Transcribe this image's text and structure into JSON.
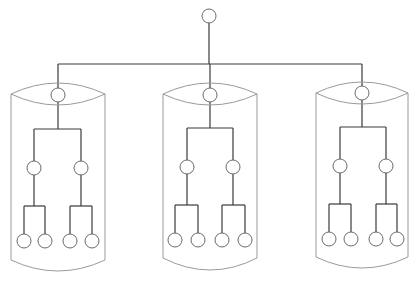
{
  "diagram": {
    "type": "hierarchical-tree",
    "colors": {
      "background": "#ffffff",
      "wire": "#3a3a3a",
      "node_stroke": "#6a6a6a",
      "shell_stroke": "#9a9a9a"
    },
    "root": {
      "cx": 209,
      "cy": 16,
      "r": 7
    },
    "bus": {
      "y": 64,
      "x1": 58,
      "x2": 362
    },
    "groups": [
      {
        "name": "left",
        "shell": {
          "left": 11,
          "right": 105,
          "lens_mid_y": 94,
          "lens_top_y": 83,
          "lens_bottom_y": 105,
          "side_bottom_y": 260,
          "bottom_arc_y": 271
        },
        "top_node": {
          "cx": 58,
          "cy": 95
        },
        "split_y": 129,
        "mid_nodes": [
          {
            "cx": 34,
            "cy": 168
          },
          {
            "cx": 81,
            "cy": 168
          }
        ],
        "leaf_split_y": 206,
        "leaves": [
          {
            "cx": 24,
            "cy": 241
          },
          {
            "cx": 45,
            "cy": 241
          },
          {
            "cx": 70,
            "cy": 241
          },
          {
            "cx": 92,
            "cy": 241
          }
        ]
      },
      {
        "name": "middle",
        "shell": {
          "left": 163,
          "right": 257,
          "lens_mid_y": 94,
          "lens_top_y": 83,
          "lens_bottom_y": 105,
          "side_bottom_y": 258,
          "bottom_arc_y": 270
        },
        "top_node": {
          "cx": 210,
          "cy": 95
        },
        "split_y": 128,
        "mid_nodes": [
          {
            "cx": 187,
            "cy": 167
          },
          {
            "cx": 233,
            "cy": 167
          }
        ],
        "leaf_split_y": 205,
        "leaves": [
          {
            "cx": 175,
            "cy": 240
          },
          {
            "cx": 198,
            "cy": 240
          },
          {
            "cx": 222,
            "cy": 240
          },
          {
            "cx": 245,
            "cy": 240
          }
        ]
      },
      {
        "name": "right",
        "shell": {
          "left": 316,
          "right": 408,
          "lens_mid_y": 93,
          "lens_top_y": 82,
          "lens_bottom_y": 104,
          "side_bottom_y": 257,
          "bottom_arc_y": 268
        },
        "top_node": {
          "cx": 362,
          "cy": 93
        },
        "split_y": 127,
        "mid_nodes": [
          {
            "cx": 340,
            "cy": 166
          },
          {
            "cx": 386,
            "cy": 166
          }
        ],
        "leaf_split_y": 204,
        "leaves": [
          {
            "cx": 329,
            "cy": 239
          },
          {
            "cx": 351,
            "cy": 239
          },
          {
            "cx": 376,
            "cy": 239
          },
          {
            "cx": 397,
            "cy": 239
          }
        ]
      }
    ],
    "node_radius": 7
  }
}
